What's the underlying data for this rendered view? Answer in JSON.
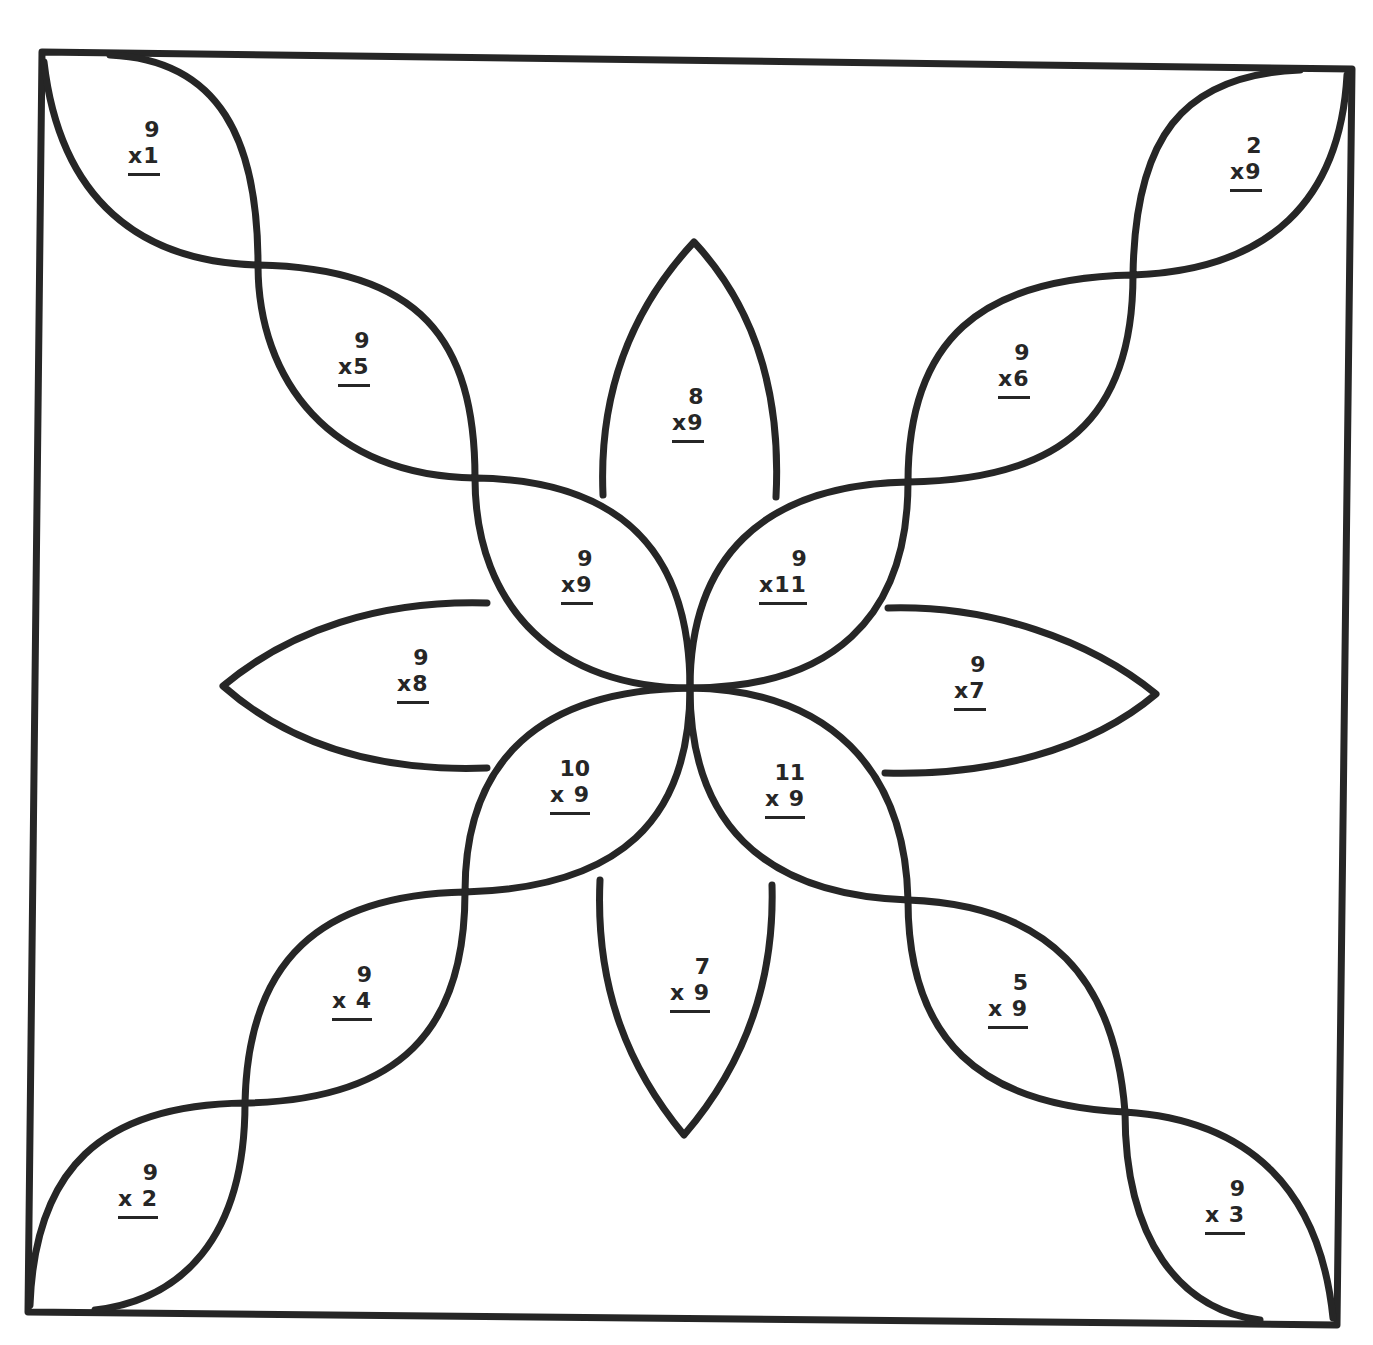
{
  "worksheet": {
    "title": "",
    "stroke_color": "#262626",
    "background": "#ffffff",
    "problems": [
      {
        "id": "corner-top-left",
        "top": "9",
        "bottom": "x1",
        "x": 128,
        "y": 117
      },
      {
        "id": "corner-top-right",
        "top": "2",
        "bottom": "x9",
        "x": 1230,
        "y": 133
      },
      {
        "id": "arm-upper-left",
        "top": "9",
        "bottom": "x5",
        "x": 338,
        "y": 328
      },
      {
        "id": "petal-top",
        "top": "8",
        "bottom": "x9",
        "x": 672,
        "y": 384
      },
      {
        "id": "arm-upper-right",
        "top": "9",
        "bottom": "x6",
        "x": 998,
        "y": 340
      },
      {
        "id": "inner-upper-left",
        "top": "9",
        "bottom": "x9",
        "x": 561,
        "y": 546
      },
      {
        "id": "inner-upper-right",
        "top": "9",
        "bottom": "x11",
        "x": 759,
        "y": 546
      },
      {
        "id": "petal-left",
        "top": "9",
        "bottom": "x8",
        "x": 397,
        "y": 645
      },
      {
        "id": "petal-right",
        "top": "9",
        "bottom": "x7",
        "x": 954,
        "y": 652
      },
      {
        "id": "inner-lower-left",
        "top": "10",
        "bottom": "x 9",
        "x": 550,
        "y": 756
      },
      {
        "id": "inner-lower-right",
        "top": "11",
        "bottom": "x 9",
        "x": 765,
        "y": 760
      },
      {
        "id": "petal-bottom",
        "top": "7",
        "bottom": "x 9",
        "x": 670,
        "y": 954
      },
      {
        "id": "arm-lower-left",
        "top": "9",
        "bottom": "x 4",
        "x": 332,
        "y": 962
      },
      {
        "id": "arm-lower-right",
        "top": "5",
        "bottom": "x 9",
        "x": 988,
        "y": 970
      },
      {
        "id": "corner-bottom-left",
        "top": "9",
        "bottom": "x 2",
        "x": 118,
        "y": 1160
      },
      {
        "id": "corner-bottom-right",
        "top": "9",
        "bottom": "x 3",
        "x": 1205,
        "y": 1176
      }
    ]
  }
}
